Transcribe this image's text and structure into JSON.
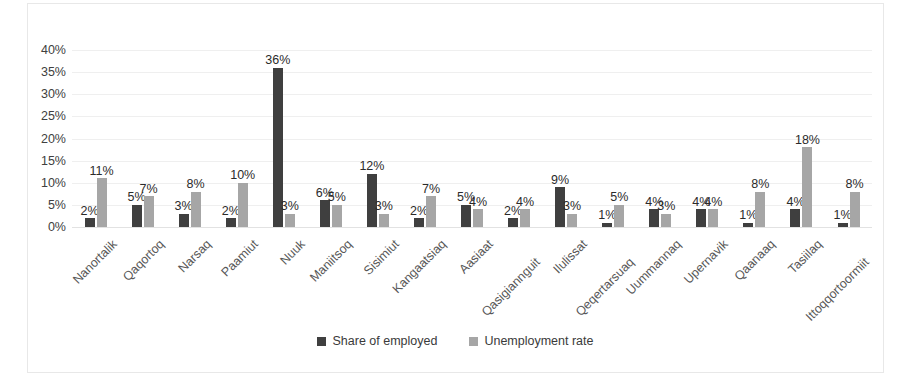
{
  "chart_data": {
    "type": "bar",
    "title": "",
    "subtitle": "",
    "xlabel": "",
    "ylabel": "",
    "ylim": [
      0,
      40
    ],
    "ytick_labels": [
      "40%",
      "35%",
      "30%",
      "25%",
      "20%",
      "15%",
      "10%",
      "5%",
      "0%"
    ],
    "ytick_values": [
      40,
      35,
      30,
      25,
      20,
      15,
      10,
      5,
      0
    ],
    "grid": true,
    "legend_position": "bottom",
    "value_suffix": "%",
    "categories": [
      "Nanortalik",
      "Qaqortoq",
      "Narsaq",
      "Paamiut",
      "Nuuk",
      "Maniitsoq",
      "Sisimiut",
      "Kangaatsiaq",
      "Aasiaat",
      "Qasigiannguit",
      "Ilulissat",
      "Qeqertarsuaq",
      "Uummannaq",
      "Upernavik",
      "Qaanaaq",
      "Tasiilaq",
      "Ittoqqortoormiit"
    ],
    "series": [
      {
        "name": "Share of employed",
        "color": "#3f3f3f",
        "values": [
          2,
          5,
          3,
          2,
          36,
          6,
          12,
          2,
          5,
          2,
          9,
          1,
          4,
          4,
          1,
          4,
          1
        ],
        "labels": [
          "2%",
          "5%",
          "3%",
          "2%",
          "36%",
          "6%",
          "12%",
          "2%",
          "5%",
          "2%",
          "9%",
          "1%",
          "4%",
          "4%",
          "1%",
          "4%",
          "1%"
        ]
      },
      {
        "name": "Unemployment rate",
        "color": "#a6a6a6",
        "values": [
          11,
          7,
          8,
          10,
          3,
          5,
          3,
          7,
          4,
          4,
          3,
          5,
          3,
          4,
          8,
          18,
          8
        ],
        "labels": [
          "11%",
          "7%",
          "8%",
          "10%",
          "3%",
          "5%",
          "3%",
          "7%",
          "4%",
          "4%",
          "3%",
          "5%",
          "3%",
          "4%",
          "8%",
          "18%",
          "8%"
        ]
      }
    ]
  },
  "legend": {
    "items": [
      {
        "label": "Share of employed",
        "marker": "square-dark"
      },
      {
        "label": "Unemployment rate",
        "marker": "square-light"
      }
    ]
  },
  "colors": {
    "series1": "#3f3f3f",
    "series2": "#a6a6a6",
    "gridline": "#efefef",
    "frame": "#e8e8e8",
    "axis_text": "#404040",
    "category_text": "#585858"
  }
}
